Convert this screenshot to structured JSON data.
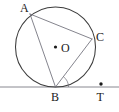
{
  "figure": {
    "type": "geometry-diagram",
    "background_color": "#ffffff",
    "ink_color": "#3c3c3c",
    "chord_color": "#6e6e78",
    "label_color": "#1a1a1a",
    "canvas": {
      "width": 119,
      "height": 112
    },
    "circle": {
      "name": "circle-o",
      "center": {
        "x": 55.5,
        "y": 47
      },
      "radius": 40
    },
    "points": [
      {
        "id": "A",
        "label": "A",
        "x": 30,
        "y": 14,
        "label_x": 20,
        "label_y": 12,
        "on_circle": true,
        "dot": false
      },
      {
        "id": "C",
        "label": "C",
        "x": 92,
        "y": 39,
        "label_x": 96,
        "label_y": 41,
        "on_circle": true,
        "dot": false
      },
      {
        "id": "O",
        "label": "O",
        "x": 55.5,
        "y": 47,
        "label_x": 61,
        "label_y": 52,
        "on_circle": false,
        "dot": true
      },
      {
        "id": "B",
        "label": "B",
        "x": 55.5,
        "y": 87,
        "label_x": 51,
        "label_y": 101,
        "on_circle": true,
        "dot": false
      },
      {
        "id": "T",
        "label": "T",
        "x": 101,
        "y": 84,
        "label_x": 96.5,
        "label_y": 101,
        "on_circle": false,
        "dot": true
      }
    ],
    "segments": [
      {
        "id": "AB",
        "from": "A",
        "to": "B",
        "style": "chord"
      },
      {
        "id": "AC",
        "from": "A",
        "to": "C",
        "style": "chord"
      },
      {
        "id": "BC",
        "from": "B",
        "to": "C",
        "style": "chord"
      }
    ],
    "tangent_line": {
      "name": "tangent-at-b",
      "x1": 0,
      "y1": 87,
      "x2": 119,
      "y2": 87,
      "touches_point": "B"
    },
    "angle_marks": [
      {
        "id": "angle-TBC",
        "vertex": "B",
        "between": [
          "BC",
          "BT"
        ],
        "radius": 13
      }
    ],
    "labels": {
      "A": "A",
      "B": "B",
      "C": "C",
      "O": "O",
      "T": "T"
    }
  }
}
